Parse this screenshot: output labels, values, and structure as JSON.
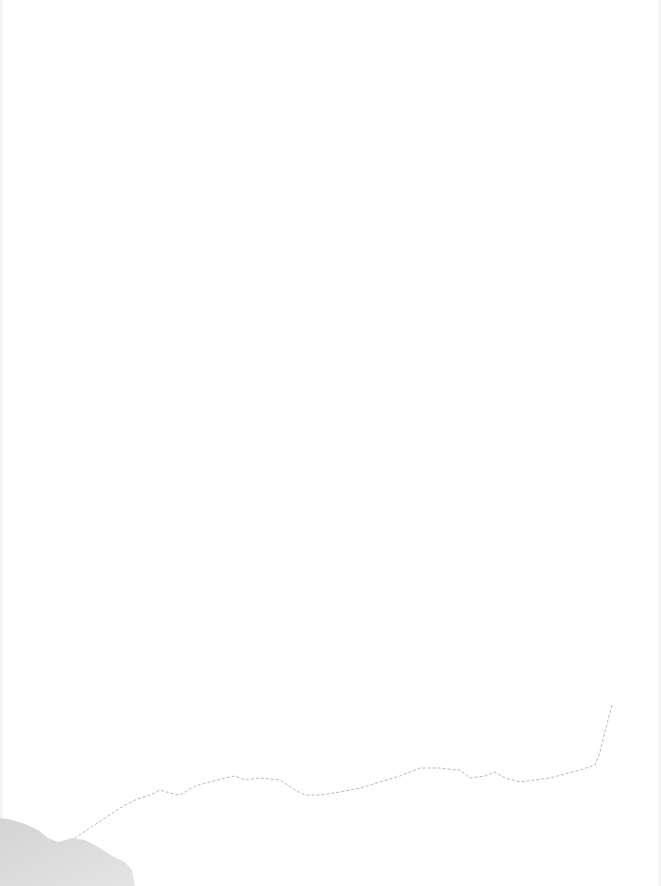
{
  "page": {
    "type": "blank scanned page",
    "text": "",
    "background_color": "#ffffff",
    "features": [
      {
        "name": "torn-edge-line",
        "color": "#b8b8b8"
      },
      {
        "name": "corner-smudge",
        "color": "#c8c8c8"
      }
    ]
  }
}
